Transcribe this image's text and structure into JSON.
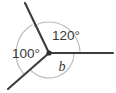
{
  "figure": {
    "type": "angles-around-a-point-diagram",
    "background_color": "#ffffff",
    "ray_color": "#3c3c3c",
    "arc_color": "#b9b9b9",
    "text_color": "#3a3a3a",
    "vertex": {
      "x": 49,
      "y": 53
    },
    "rays": [
      {
        "name": "ray-right",
        "label": "",
        "angle_deg": 0,
        "end": {
          "x": 113,
          "y": 53
        }
      },
      {
        "name": "ray-upper-left",
        "label": "",
        "angle_deg": 120,
        "end": {
          "x": 25,
          "y": 3
        }
      },
      {
        "name": "ray-lower-left",
        "label": "",
        "angle_deg": 220,
        "end": {
          "x": 8,
          "y": 89
        }
      }
    ],
    "angles": [
      {
        "name": "angle-120",
        "label": "120°",
        "value": 120,
        "unit": "degrees",
        "label_x": 66,
        "label_y": 40,
        "arc_radius": 31,
        "start_deg": 0,
        "end_deg": 120
      },
      {
        "name": "angle-100",
        "label": "100°",
        "value": 100,
        "unit": "degrees",
        "label_x": 26,
        "label_y": 58,
        "arc_radius": 33,
        "start_deg": 120,
        "end_deg": 220
      },
      {
        "name": "angle-b",
        "label": "b",
        "value": null,
        "unit": "degrees",
        "label_x": 62,
        "label_y": 71,
        "arc_radius": 25,
        "start_deg": 220,
        "end_deg": 360
      }
    ]
  }
}
